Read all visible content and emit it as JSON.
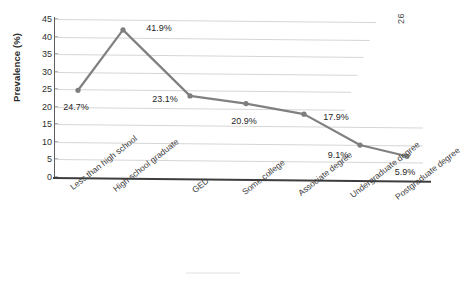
{
  "chart_data": {
    "type": "line",
    "title": "",
    "xlabel": "",
    "ylabel": "Prevalence (%)",
    "ylim": [
      0,
      45
    ],
    "ytick_step": 5,
    "yticks": [
      0,
      5,
      10,
      15,
      20,
      25,
      30,
      35,
      40,
      45
    ],
    "ytick_labels": [
      "0",
      "5",
      "10",
      "15",
      "20",
      "25",
      "30",
      "35",
      "40",
      "45"
    ],
    "grid": true,
    "legend": "none",
    "categories": [
      "Less than high school",
      "High school graduate",
      "GED",
      "Some college",
      "Associate degree",
      "Undergraduate degree",
      "Postgraduate degree"
    ],
    "values": [
      24.7,
      41.9,
      23.1,
      20.9,
      17.9,
      9.1,
      5.9
    ],
    "data_labels": [
      "24.7%",
      "41.9%",
      "23.1%",
      "20.9%",
      "17.9%",
      "9.1%",
      "5.9%"
    ],
    "series": [
      {
        "name": "Prevalence",
        "values": [
          24.7,
          41.9,
          23.1,
          20.9,
          17.9,
          9.1,
          5.9
        ]
      }
    ]
  },
  "style": {
    "line_color": "#808080",
    "marker_color": "#7d7d7d",
    "grid_color": "#d6d6d6",
    "axis_color": "#3d3d3d",
    "text_color": "#2f2f2f"
  },
  "artifacts": {
    "corner_mark": "26"
  }
}
